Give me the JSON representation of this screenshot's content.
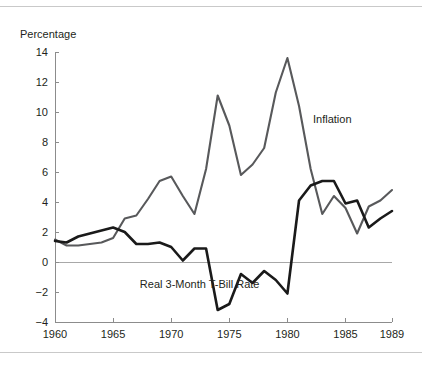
{
  "figure": {
    "ylabel_top": "Percentage",
    "rules": {
      "top": true,
      "bottom": true
    }
  },
  "chart_data": {
    "type": "line",
    "title": "",
    "subtitle": "",
    "xlabel": "",
    "ylabel": "Percentage",
    "xlim": [
      1960,
      1989
    ],
    "ylim": [
      -4,
      14
    ],
    "yticks": [
      -4,
      -2,
      0,
      2,
      4,
      6,
      8,
      10,
      12,
      14
    ],
    "ytick_labels": [
      "−4",
      "−2",
      "0",
      "2",
      "4",
      "6",
      "8",
      "10",
      "12",
      "14"
    ],
    "xticks": [
      1960,
      1965,
      1970,
      1975,
      1980,
      1985,
      1989
    ],
    "xtick_labels": [
      "1960",
      "1965",
      "1970",
      "1975",
      "1980",
      "1985",
      "1989"
    ],
    "grid": false,
    "zero_line": true,
    "legend_position": "inline-annotation",
    "x": [
      1960,
      1961,
      1962,
      1963,
      1964,
      1965,
      1966,
      1967,
      1968,
      1969,
      1970,
      1971,
      1972,
      1973,
      1974,
      1975,
      1976,
      1977,
      1978,
      1979,
      1980,
      1981,
      1982,
      1983,
      1984,
      1985,
      1986,
      1987,
      1988,
      1989
    ],
    "series": [
      {
        "name": "Inflation",
        "color": "#58595b",
        "label_x": 1982.2,
        "label_y": 9.3,
        "values": [
          1.5,
          1.1,
          1.1,
          1.2,
          1.3,
          1.6,
          2.9,
          3.1,
          4.2,
          5.4,
          5.7,
          4.4,
          3.2,
          6.2,
          11.1,
          9.1,
          5.8,
          6.5,
          7.6,
          11.3,
          13.6,
          10.4,
          6.2,
          3.2,
          4.4,
          3.6,
          1.9,
          3.7,
          4.1,
          4.8
        ]
      },
      {
        "name": "Real 3-Month T-Bill Rate",
        "color": "#1a1a1a",
        "label_x": 1967.3,
        "label_y": -1.75,
        "values": [
          1.4,
          1.3,
          1.7,
          1.9,
          2.1,
          2.3,
          2.0,
          1.2,
          1.2,
          1.3,
          1.0,
          0.1,
          0.9,
          0.9,
          -3.2,
          -2.8,
          -0.8,
          -1.4,
          -0.6,
          -1.2,
          -2.1,
          4.1,
          5.1,
          5.4,
          5.4,
          3.9,
          4.1,
          2.3,
          2.9,
          3.4
        ]
      }
    ],
    "annotations": [
      {
        "text": "Inflation",
        "x": 1982.2,
        "y": 9.3
      },
      {
        "text": "Real 3-Month T-Bill Rate",
        "x": 1967.3,
        "y": -1.75
      }
    ]
  }
}
